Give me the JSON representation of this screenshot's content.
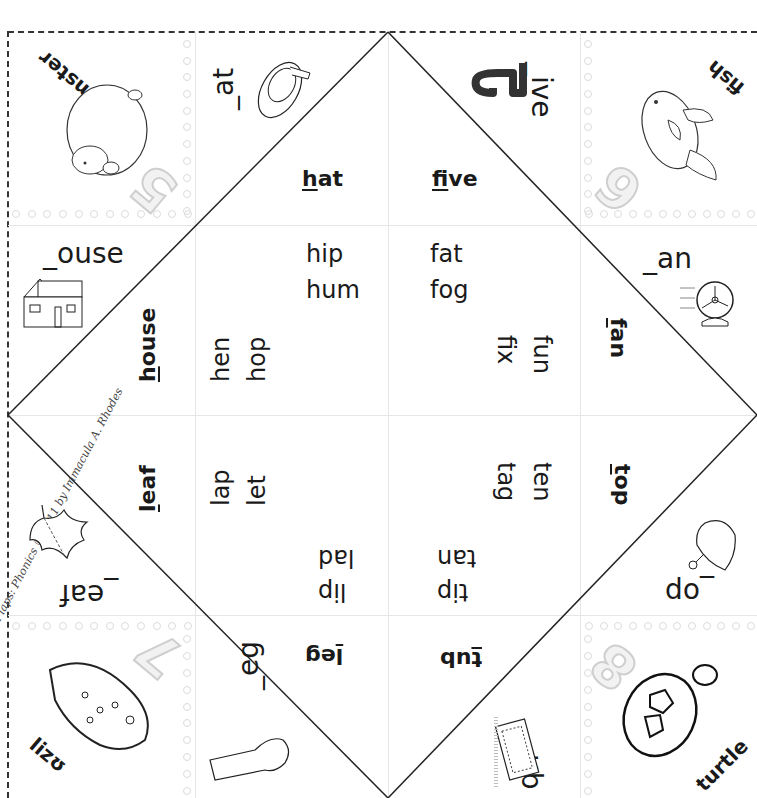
{
  "document": {
    "type": "fortune-teller-foldable",
    "theme": "initial consonant sounds h, f, l, t"
  },
  "corners": [
    {
      "position": "top-left",
      "word": "hamster",
      "number": "5",
      "icon": "hamster-picture"
    },
    {
      "position": "top-right",
      "word": "fish",
      "number": "6",
      "icon": "fish-picture"
    },
    {
      "position": "bottom-left",
      "word": "lizard",
      "visible_word": "lizʊ",
      "number": "7",
      "icon": "lizard-picture"
    },
    {
      "position": "bottom-right",
      "word": "turtle",
      "number": "8",
      "icon": "turtle-picture"
    }
  ],
  "flaps": [
    {
      "id": "hat",
      "prompt": "_at",
      "word_underlined": "h",
      "word_rest": "at",
      "icon": "hat-picture"
    },
    {
      "id": "five",
      "prompt": "_ive",
      "word_underlined": "f",
      "word_rest": "ive",
      "icon": "number-five-picture"
    },
    {
      "id": "house",
      "prompt": "_ouse",
      "word_underlined": "h",
      "word_rest": "ouse",
      "icon": "house-picture"
    },
    {
      "id": "fan",
      "prompt": "_an",
      "word_underlined": "f",
      "word_rest": "an",
      "icon": "fan-picture"
    },
    {
      "id": "leaf",
      "prompt": "_eaf",
      "word_underlined": "l",
      "word_rest": "eaf",
      "icon": "leaf-picture"
    },
    {
      "id": "top",
      "prompt": "_op",
      "word_underlined": "t",
      "word_rest": "op",
      "icon": "spinning-top-picture"
    },
    {
      "id": "leg",
      "prompt": "_eg",
      "word_underlined": "l",
      "word_rest": "eg",
      "icon": "leg-picture"
    },
    {
      "id": "tub",
      "prompt": "_ub",
      "word_underlined": "t",
      "word_rest": "ub",
      "icon": "bathtub-picture"
    }
  ],
  "inner_words": {
    "h_top": [
      "hip",
      "hum"
    ],
    "h_left": [
      "hen",
      "hop"
    ],
    "f_top": [
      "fat",
      "fog"
    ],
    "f_right": [
      "fun",
      "fix"
    ],
    "l_left": [
      "lap",
      "let"
    ],
    "l_bottom": [
      "lad",
      "lip"
    ],
    "t_right": [
      "ten",
      "tag"
    ],
    "t_bottom": [
      "tan",
      "tip"
    ]
  },
  "credit": "Fun Flaps: Phonics © 2011 by Immacula A. Rhodes"
}
